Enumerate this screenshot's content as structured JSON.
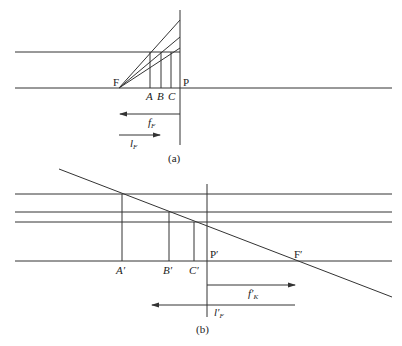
{
  "figure_a": {
    "caption": "(a)",
    "labels": {
      "F": "F",
      "P": "P",
      "A": "A",
      "B": "B",
      "C": "C",
      "f": "f",
      "f_sub": "F",
      "l": "l",
      "l_sub": "F"
    }
  },
  "figure_b": {
    "caption": "(b)",
    "labels": {
      "A": "A′",
      "B": "B′",
      "C": "C′",
      "P": "P′",
      "F": "F′",
      "f": "f′",
      "f_sub": "K",
      "l": "l′",
      "l_sub": "F"
    }
  },
  "colors": {
    "line": "#333333",
    "background": "#ffffff"
  }
}
